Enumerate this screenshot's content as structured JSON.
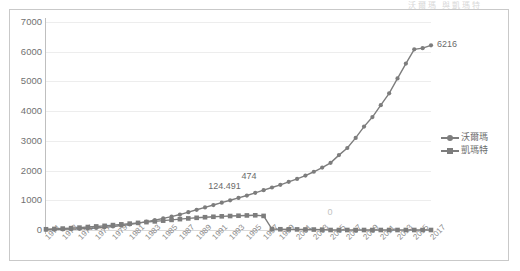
{
  "header": {
    "ghost_text": "沃爾瑪  與凱瑪特"
  },
  "legend": {
    "position": "right-middle",
    "items": [
      {
        "label": "沃爾瑪",
        "marker": "circle",
        "color": "#7d7d7d"
      },
      {
        "label": "凱瑪特",
        "marker": "square",
        "color": "#7d7d7d"
      }
    ]
  },
  "annotations": [
    {
      "text": "124.491",
      "series": "沃爾瑪",
      "x": "1993",
      "faint": false
    },
    {
      "text": "474",
      "series": "沃爾瑪",
      "x": "1997",
      "faint": false
    },
    {
      "text": "0",
      "series": "凱瑪特",
      "x": "2005",
      "faint": true
    },
    {
      "text": "6216",
      "series": "沃爾瑪",
      "x": "2017",
      "faint": false
    }
  ],
  "chart_data": {
    "type": "line",
    "title": "",
    "subtitle": "",
    "xlabel": "",
    "ylabel": "",
    "ylim": [
      0,
      7000
    ],
    "ytick_step": 1000,
    "yticks": [
      "0",
      "1000",
      "2000",
      "3000",
      "4000",
      "5000",
      "6000",
      "7000"
    ],
    "grid": true,
    "legend_position": "right",
    "categories": [
      "1971",
      "1972",
      "1973",
      "1974",
      "1975",
      "1976",
      "1977",
      "1978",
      "1979",
      "1980",
      "1981",
      "1982",
      "1983",
      "1984",
      "1985",
      "1986",
      "1987",
      "1988",
      "1989",
      "1990",
      "1991",
      "1992",
      "1993",
      "1994",
      "1995",
      "1996",
      "1997",
      "1998",
      "1999",
      "2000",
      "2001",
      "2002",
      "2003",
      "2004",
      "2005",
      "2006",
      "2007",
      "2008",
      "2009",
      "2010",
      "2011",
      "2012",
      "2013",
      "2014",
      "2015",
      "2016",
      "2017"
    ],
    "tick_labels": [
      "1971",
      "1973",
      "1975",
      "1977",
      "1979",
      "1981",
      "1983",
      "1985",
      "1987",
      "1989",
      "1991",
      "1993",
      "1995",
      "1997",
      "1999",
      "2001",
      "2003",
      "2005",
      "2007",
      "2009",
      "2011",
      "2013",
      "2015",
      "2017"
    ],
    "series": [
      {
        "name": "沃爾瑪",
        "marker": "circle",
        "color": "#7d7d7d",
        "values": [
          10,
          15,
          20,
          28,
          38,
          52,
          68,
          90,
          120,
          150,
          185,
          230,
          280,
          330,
          390,
          450,
          520,
          600,
          680,
          760,
          840,
          920,
          1000,
          1080,
          1160,
          1250,
          1340,
          1430,
          1520,
          1620,
          1720,
          1830,
          1960,
          2100,
          2260,
          2520,
          2760,
          3100,
          3480,
          3800,
          4200,
          4600,
          5100,
          5600,
          6080,
          6120,
          6216
        ]
      },
      {
        "name": "凱瑪特",
        "marker": "square",
        "color": "#7d7d7d",
        "values": [
          25,
          35,
          48,
          62,
          80,
          100,
          120,
          140,
          165,
          190,
          215,
          240,
          265,
          290,
          315,
          340,
          365,
          390,
          410,
          430,
          445,
          460,
          470,
          480,
          490,
          495,
          474,
          30,
          25,
          22,
          20,
          18,
          15,
          12,
          0,
          0,
          0,
          0,
          0,
          0,
          0,
          0,
          0,
          0,
          0,
          0,
          0
        ]
      }
    ]
  }
}
